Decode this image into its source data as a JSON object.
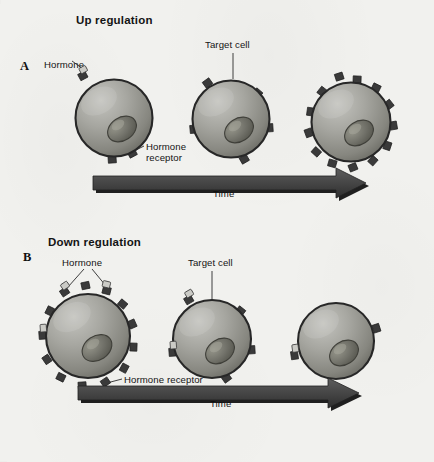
{
  "figure": {
    "background_color": "#f1f1ee",
    "ink_color": "#141414"
  },
  "panels": [
    {
      "id": "up-regulation",
      "letter": "A",
      "title": "Up regulation",
      "labels": {
        "hormone": "Hormone",
        "target_cell": "Target cell",
        "hormone_receptor_line1": "Hormone",
        "hormone_receptor_line2": "receptor",
        "time": "Time"
      },
      "cells": [
        {
          "index": 1,
          "receptor_count": 3,
          "hormone_count": 1,
          "diameter_px": 75
        },
        {
          "index": 2,
          "receptor_count": 5,
          "hormone_count": 0,
          "diameter_px": 75
        },
        {
          "index": 3,
          "receptor_count": 13,
          "hormone_count": 0,
          "diameter_px": 78
        }
      ],
      "trend": "receptor number increases over time"
    },
    {
      "id": "down-regulation",
      "letter": "B",
      "title": "Down regulation",
      "labels": {
        "hormone": "Hormone",
        "target_cell": "Target cell",
        "hormone_receptor": "Hormone receptor",
        "time": "Time"
      },
      "cells": [
        {
          "index": 1,
          "receptor_count": 13,
          "hormone_count": 3,
          "diameter_px": 84
        },
        {
          "index": 2,
          "receptor_count": 5,
          "hormone_count": 2,
          "diameter_px": 78
        },
        {
          "index": 3,
          "receptor_count": 2,
          "hormone_count": 1,
          "diameter_px": 76
        }
      ],
      "trend": "receptor number decreases over time"
    }
  ],
  "colors": {
    "cell_fill_light": "#b9b9b4",
    "cell_fill_mid": "#9a9a95",
    "cell_fill_dark": "#6e6e69",
    "cell_outline": "#2b2b2b",
    "nucleus_fill": "#6f6f68",
    "nucleus_highlight": "#8d8d85",
    "receptor_fill": "#3a3a3a",
    "hormone_fill": "#c9c9c4",
    "arrow_body": "#4a4a4a",
    "arrow_shadow": "#0d0d0d"
  }
}
